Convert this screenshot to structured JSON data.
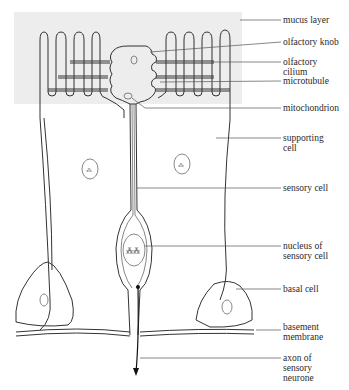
{
  "diagram": {
    "colors": {
      "mucus": "#ededed",
      "line": "#333333",
      "background": "#ffffff"
    },
    "labels": [
      {
        "id": "mucus-layer",
        "text": "mucus layer"
      },
      {
        "id": "olfactory-knob",
        "text": "olfactory knob"
      },
      {
        "id": "olfactory-cilium",
        "text": "olfactory\ncilium"
      },
      {
        "id": "microtubule",
        "text": "microtubule"
      },
      {
        "id": "mitochondrion",
        "text": "mitochondrion"
      },
      {
        "id": "supporting-cell",
        "text": "supporting\ncell"
      },
      {
        "id": "sensory-cell",
        "text": "sensory cell"
      },
      {
        "id": "nucleus-of-sensory-cell",
        "text": "nucleus of\nsensory cell"
      },
      {
        "id": "basal-cell",
        "text": "basal cell"
      },
      {
        "id": "basement-membrane",
        "text": "basement\nmembrane"
      },
      {
        "id": "axon-of-sensory-neurone",
        "text": "axon of\nsensory\nneurone"
      }
    ]
  }
}
